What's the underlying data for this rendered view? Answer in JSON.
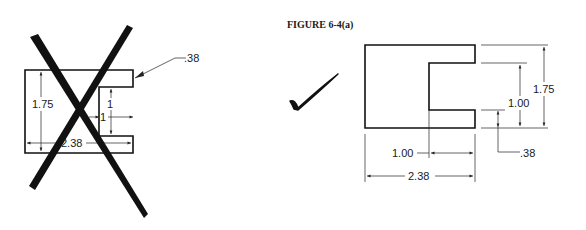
{
  "figure": {
    "caption": "FIGURE 6-4(a)"
  },
  "incorrect_drawing": {
    "status": "incorrect",
    "mark": "x-cross",
    "dims": {
      "height": "1.75",
      "width": "2.38",
      "slot_height": "1",
      "slot_depth": "1",
      "flange": ".38"
    }
  },
  "correct_drawing": {
    "status": "correct",
    "mark": "check-mark",
    "dims": {
      "height": "1.75",
      "slot_height": "1.00",
      "slot_depth": "1.00",
      "width": "2.38",
      "flange": ".38"
    }
  },
  "colors": {
    "ink": "#111111",
    "background": "#ffffff"
  }
}
